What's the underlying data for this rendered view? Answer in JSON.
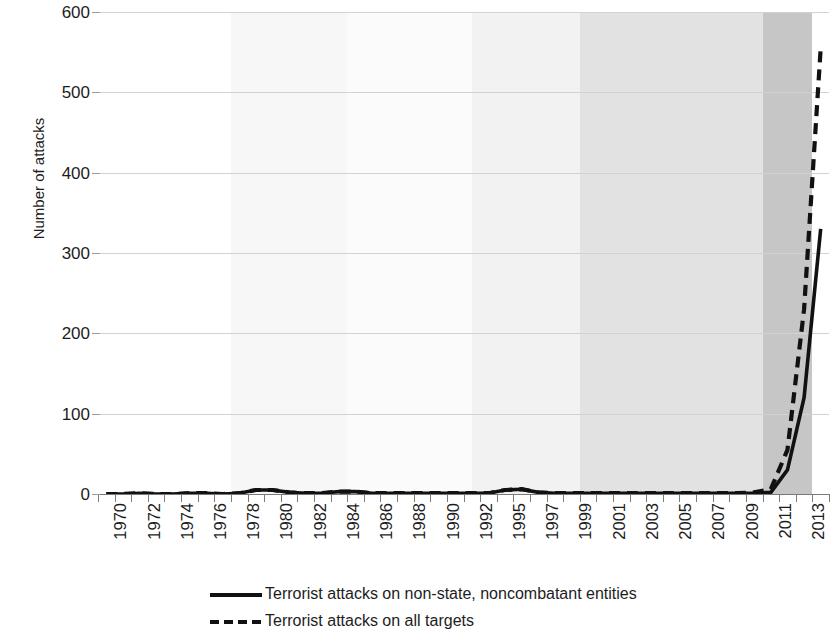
{
  "chart_data": {
    "type": "line",
    "title": "",
    "xlabel": "",
    "ylabel": "Number of attacks",
    "ylim": [
      0,
      600
    ],
    "yticks": [
      0,
      100,
      200,
      300,
      400,
      500,
      600
    ],
    "grid": true,
    "legend_position": "bottom",
    "x": [
      1970,
      1971,
      1972,
      1973,
      1974,
      1975,
      1976,
      1977,
      1978,
      1979,
      1980,
      1981,
      1982,
      1983,
      1984,
      1985,
      1986,
      1987,
      1988,
      1989,
      1990,
      1991,
      1992,
      1994,
      1995,
      1996,
      1997,
      1998,
      1999,
      2000,
      2001,
      2002,
      2003,
      2004,
      2005,
      2006,
      2007,
      2008,
      2009,
      2010,
      2011,
      2012,
      2013,
      2014
    ],
    "x_tick_labels": [
      "1970",
      "1972",
      "1974",
      "1976",
      "1978",
      "1980",
      "1982",
      "1984",
      "1986",
      "1988",
      "1990",
      "1992",
      "1995",
      "1997",
      "1999",
      "2001",
      "2003",
      "2005",
      "2007",
      "2009",
      "2011",
      "2013"
    ],
    "note_missing_year": 1993,
    "series": [
      {
        "name": "Terrorist attacks on non-state, noncombatant entities",
        "style": "solid",
        "color": "#111111",
        "values": [
          0,
          0,
          1,
          0,
          0,
          1,
          1,
          0,
          1,
          5,
          5,
          2,
          1,
          1,
          3,
          3,
          1,
          1,
          1,
          1,
          1,
          1,
          1,
          1,
          5,
          6,
          2,
          1,
          1,
          1,
          1,
          1,
          1,
          1,
          1,
          1,
          1,
          1,
          1,
          1,
          2,
          30,
          120,
          330
        ]
      },
      {
        "name": "Terrorist attacks on all targets",
        "style": "dashed",
        "color": "#111111",
        "values": [
          0,
          0,
          1,
          0,
          0,
          1,
          1,
          0,
          1,
          5,
          5,
          2,
          1,
          1,
          3,
          3,
          1,
          1,
          1,
          1,
          1,
          1,
          1,
          1,
          5,
          6,
          2,
          1,
          1,
          1,
          1,
          1,
          1,
          1,
          1,
          1,
          1,
          1,
          1,
          2,
          6,
          55,
          230,
          555
        ]
      }
    ]
  },
  "legend": {
    "entries": [
      {
        "label": "Terrorist attacks on non-state, noncombatant entities",
        "style": "solid"
      },
      {
        "label": "Terrorist attacks on all targets",
        "style": "dashed"
      }
    ]
  },
  "background_bands": [
    {
      "start_year": 1970,
      "end_year": 1978,
      "color": "#ffffff"
    },
    {
      "start_year": 1978,
      "end_year": 1985,
      "color": "#f7f7f7"
    },
    {
      "start_year": 1985,
      "end_year": 1993,
      "color": "#fbfbfb"
    },
    {
      "start_year": 1993,
      "end_year": 2000,
      "color": "#f2f2f2"
    },
    {
      "start_year": 2000,
      "end_year": 2011,
      "color": "#e2e2e2"
    },
    {
      "start_year": 2011,
      "end_year": 2014,
      "color": "#c6c6c6"
    }
  ]
}
